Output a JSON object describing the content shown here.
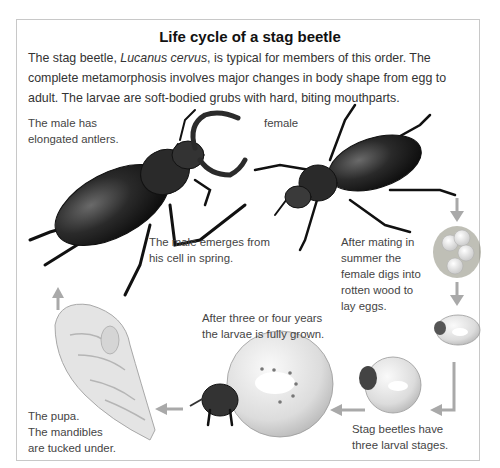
{
  "diagram": {
    "title": "Life cycle of a stag beetle",
    "intro": {
      "before_italic": "The stag beetle, ",
      "italic": "Lucanus cervus",
      "after_italic": ", is typical for members of this order. The complete metamorphosis involves major changes in body shape from egg to adult. The larvae are soft-bodied grubs with hard, biting mouthparts."
    },
    "stages": [
      {
        "id": "male",
        "caption_line1": "The male has",
        "caption_line2": "elongated antlers."
      },
      {
        "id": "female",
        "caption_line1": "female"
      },
      {
        "id": "male-emerges",
        "caption_line1": "The male emerges from",
        "caption_line2": "his cell in spring."
      },
      {
        "id": "eggs",
        "caption_line1": "After mating in",
        "caption_line2": "summer the",
        "caption_line3": "female digs into",
        "caption_line4": "rotten wood to",
        "caption_line5": "lay eggs."
      },
      {
        "id": "grown-larva",
        "caption_line1": "After three or four years",
        "caption_line2": "the larvae is fully grown."
      },
      {
        "id": "larval-stages",
        "caption_line1": "Stag beetles have",
        "caption_line2": "three larval stages."
      },
      {
        "id": "pupa",
        "caption_line1": "The pupa.",
        "caption_line2": "The mandibles",
        "caption_line3": "are tucked under."
      }
    ],
    "colors": {
      "arrow": "#a9a9a9",
      "beetle_dark": "#1e1e1e",
      "larva": "#e6e6e6",
      "frame": "#c8c8c8"
    }
  }
}
